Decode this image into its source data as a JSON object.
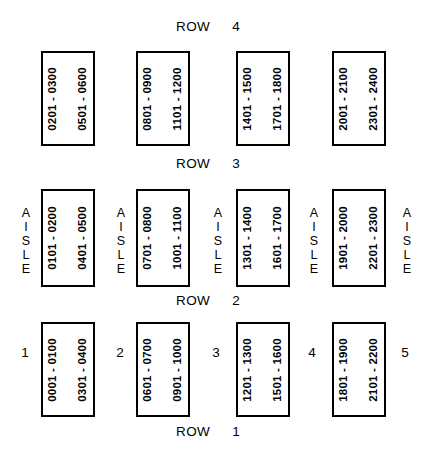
{
  "diagram": {
    "row_word": "ROW",
    "aisle_word": "AISLE",
    "aisle_letters": [
      "A",
      "I",
      "S",
      "L",
      "E"
    ]
  },
  "row_captions": [
    {
      "label": "ROW",
      "number": "4"
    },
    {
      "label": "ROW",
      "number": "3"
    },
    {
      "label": "ROW",
      "number": "2"
    },
    {
      "label": "ROW",
      "number": "1"
    }
  ],
  "aisle_labels": [
    {
      "word": "AISLE"
    },
    {
      "word": "AISLE"
    },
    {
      "word": "AISLE"
    },
    {
      "word": "AISLE"
    },
    {
      "word": "AISLE"
    }
  ],
  "aisle_numbers": [
    "1",
    "2",
    "3",
    "4",
    "5"
  ],
  "bands": [
    {
      "band_name": "top-band",
      "racks": [
        {
          "left": "0201 - 0300",
          "right": "0501 - 0600"
        },
        {
          "left": "0801 - 0900",
          "right": "1101 - 1200"
        },
        {
          "left": "1401 - 1500",
          "right": "1701 - 1800"
        },
        {
          "left": "2001 - 2100",
          "right": "2301 - 2400"
        }
      ]
    },
    {
      "band_name": "middle-band",
      "racks": [
        {
          "left": "0101 - 0200",
          "right": "0401 - 0500"
        },
        {
          "left": "0701 - 0800",
          "right": "1001 - 1100"
        },
        {
          "left": "1301 - 1400",
          "right": "1601 - 1700"
        },
        {
          "left": "1901 - 2000",
          "right": "2201 - 2300"
        }
      ]
    },
    {
      "band_name": "bottom-band",
      "racks": [
        {
          "left": "0001 - 0100",
          "right": "0301 - 0400"
        },
        {
          "left": "0601 - 0700",
          "right": "0901 - 1000"
        },
        {
          "left": "1201 - 1300",
          "right": "1501 - 1600"
        },
        {
          "left": "1801 - 1900",
          "right": "2101 - 2200"
        }
      ]
    }
  ],
  "colors": {
    "ink": "#000000",
    "paper": "#ffffff"
  }
}
